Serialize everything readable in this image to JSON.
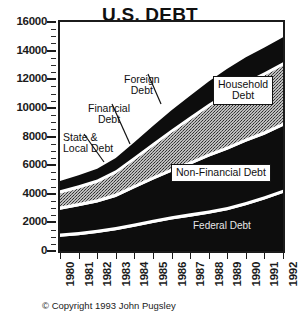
{
  "chart_data": {
    "type": "area",
    "title": "U.S. DEBT",
    "subtitle": "(Billions of Dollars)",
    "xlabel": "",
    "ylabel": "",
    "ylim": [
      0,
      16000
    ],
    "xlim": [
      1980,
      1992
    ],
    "grid": false,
    "stacked": true,
    "legend_position": "in-plot annotations",
    "y_ticks": [
      0,
      2000,
      4000,
      6000,
      8000,
      10000,
      12000,
      14000,
      16000
    ],
    "y_tick_labels": [
      "0",
      "2000",
      "4000",
      "6000",
      "8000",
      "10000",
      "12000",
      "14000",
      "16000"
    ],
    "categories": [
      1980,
      1981,
      1982,
      1983,
      1984,
      1985,
      1986,
      1987,
      1988,
      1989,
      1990,
      1991,
      1992
    ],
    "x_tick_labels": [
      "1980",
      "1981",
      "1982",
      "1983",
      "1984",
      "1985",
      "1986",
      "1987",
      "1988",
      "1989",
      "1990",
      "1991",
      "1992"
    ],
    "series": [
      {
        "name": "Federal Debt",
        "fill": "black",
        "values": [
          1000,
          1100,
          1250,
          1450,
          1700,
          1950,
          2200,
          2400,
          2600,
          2850,
          3200,
          3600,
          4050
        ]
      },
      {
        "name": "Non-Financial Debt",
        "fill": "black",
        "values": [
          1650,
          1800,
          1900,
          2100,
          2450,
          2800,
          3100,
          3400,
          3750,
          4000,
          4200,
          4300,
          4450
        ]
      },
      {
        "name": "Financial Debt",
        "fill": "gray-stipple",
        "values": [
          900,
          1000,
          1150,
          1400,
          1750,
          2100,
          2500,
          2900,
          3250,
          3550,
          3750,
          3900,
          4000
        ]
      },
      {
        "name": "Household Debt",
        "fill": "black",
        "values": [
          650,
          700,
          750,
          850,
          1000,
          1200,
          1350,
          1450,
          1550,
          1650,
          1700,
          1730,
          1750
        ]
      }
    ],
    "totals": [
      4200,
      4600,
      5050,
      5800,
      6900,
      8050,
      9150,
      10150,
      11150,
      12050,
      12850,
      13530,
      14250
    ],
    "annotations": [
      {
        "id": "foreign-debt",
        "text_lines": [
          "Foreign",
          "Debt"
        ],
        "style": "plain",
        "leader": true
      },
      {
        "id": "financial-debt",
        "text_lines": [
          "Financial",
          "Debt"
        ],
        "style": "plain",
        "leader": true
      },
      {
        "id": "state-local-debt",
        "text_lines": [
          "State &",
          "Local Debt"
        ],
        "style": "plain",
        "leader": true
      },
      {
        "id": "household-debt",
        "text_lines": [
          "Household",
          "Debt"
        ],
        "style": "boxed",
        "leader": false
      },
      {
        "id": "non-financial-debt",
        "text_lines": [
          "Non-Financial Debt"
        ],
        "style": "boxed",
        "leader": false
      },
      {
        "id": "federal-debt",
        "text_lines": [
          "Federal Debt"
        ],
        "style": "on-black",
        "leader": false
      }
    ]
  },
  "header": {
    "title": "U.S. DEBT",
    "subtitle": "(Billions of Dollars)"
  },
  "annotations": {
    "foreign_line1": "Foreign",
    "foreign_line2": "Debt",
    "financial_line1": "Financial",
    "financial_line2": "Debt",
    "state_line1": "State &",
    "state_line2": "Local Debt",
    "household_line1": "Household",
    "household_line2": "Debt",
    "non_financial": "Non-Financial Debt",
    "federal": "Federal Debt"
  },
  "footer": {
    "copyright": "© Copyright 1993 John Pugsley"
  },
  "colors": {
    "ink": "#1b1b1b",
    "band_dark": "#0d0d0d",
    "band_gray": "#9a9a9a",
    "gap_white": "#ffffff",
    "page": "#ffffff"
  }
}
